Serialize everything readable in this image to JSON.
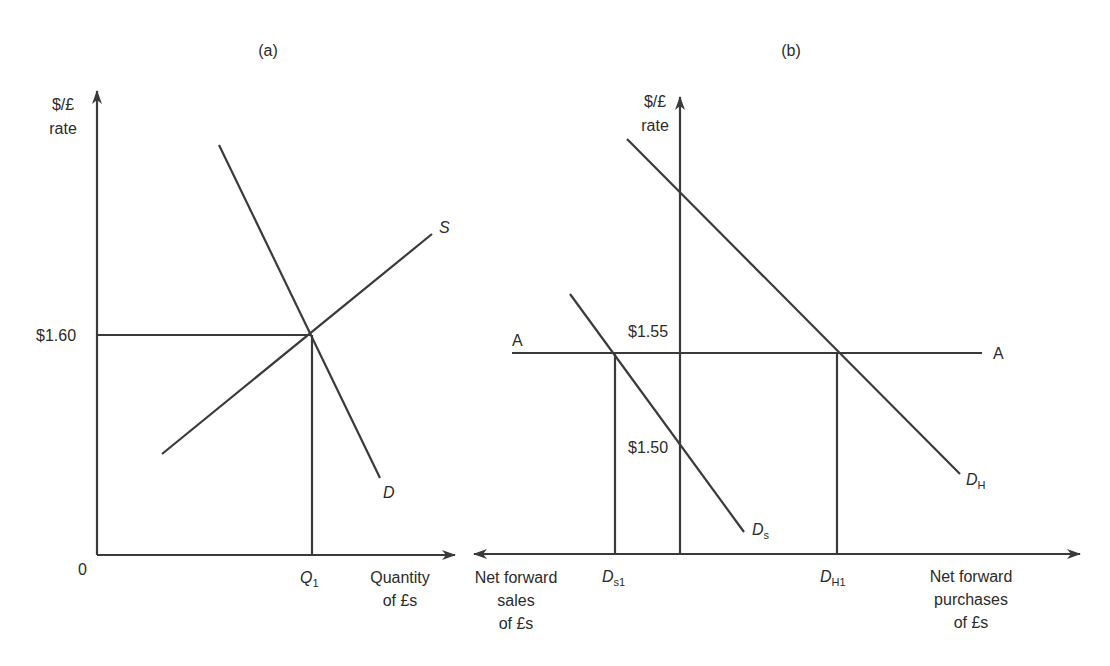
{
  "panel_a": {
    "title": "(a)",
    "y_axis_label_line1": "$/£",
    "y_axis_label_line2": "rate",
    "price_level": "$1.60",
    "origin": "0",
    "quantity_marker_main": "Q",
    "quantity_marker_sub": "1",
    "x_axis_label_line1": "Quantity",
    "x_axis_label_line2": "of £s",
    "supply_label": "S",
    "demand_label": "D"
  },
  "panel_b": {
    "title": "(b)",
    "y_axis_label_line1": "$/£",
    "y_axis_label_line2": "rate",
    "arbitrage_line_left_label": "A",
    "arbitrage_line_right_label": "A",
    "rate_155": "$1.55",
    "rate_150": "$1.50",
    "ds_label_main": "D",
    "ds_label_sub": "s",
    "dh_label_main": "D",
    "dh_label_sub": "H",
    "ds1_label_main": "D",
    "ds1_label_sub": "s1",
    "dh1_label_main": "D",
    "dh1_label_sub": "H1",
    "left_axis_label_line1": "Net forward",
    "left_axis_label_line2": "sales",
    "left_axis_label_line3": "of £s",
    "right_axis_label_line1": "Net forward",
    "right_axis_label_line2": "purchases",
    "right_axis_label_line3": "of £s"
  },
  "colors": {
    "line": "#3a3a3a",
    "background": "#ffffff"
  }
}
